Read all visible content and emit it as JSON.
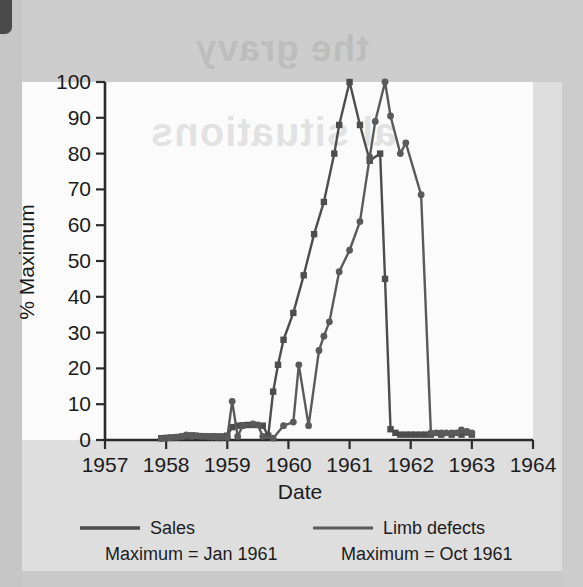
{
  "chart_data": {
    "type": "line",
    "title": "",
    "xlabel": "Date",
    "ylabel": "% Maximum",
    "xlim": [
      1957,
      1964
    ],
    "ylim": [
      0,
      100
    ],
    "xticks": [
      "1957",
      "1958",
      "1959",
      "1960",
      "1961",
      "1962",
      "1963",
      "1964"
    ],
    "yticks": [
      "0",
      "10",
      "20",
      "30",
      "40",
      "50",
      "60",
      "70",
      "80",
      "90",
      "100"
    ],
    "grid": false,
    "legend_position": "below-axes",
    "series": [
      {
        "name": "Sales",
        "note": "Maximum = Jan 1961",
        "marker": "square",
        "color": "#4d4d4d",
        "points": [
          [
            1957.92,
            0.5
          ],
          [
            1958.0,
            0.6
          ],
          [
            1958.08,
            0.7
          ],
          [
            1958.17,
            0.8
          ],
          [
            1958.25,
            0.9
          ],
          [
            1958.33,
            1.0
          ],
          [
            1958.42,
            1.3
          ],
          [
            1958.5,
            1.1
          ],
          [
            1958.58,
            1.0
          ],
          [
            1958.67,
            1.0
          ],
          [
            1958.75,
            1.0
          ],
          [
            1958.83,
            1.0
          ],
          [
            1958.92,
            1.0
          ],
          [
            1959.0,
            1.2
          ],
          [
            1959.08,
            3.6
          ],
          [
            1959.17,
            4.0
          ],
          [
            1959.25,
            4.1
          ],
          [
            1959.33,
            4.2
          ],
          [
            1959.42,
            4.2
          ],
          [
            1959.58,
            4.0
          ],
          [
            1959.67,
            1.2
          ],
          [
            1959.75,
            13.5
          ],
          [
            1959.83,
            21.0
          ],
          [
            1959.92,
            28.0
          ],
          [
            1960.08,
            35.5
          ],
          [
            1960.25,
            46.0
          ],
          [
            1960.42,
            57.5
          ],
          [
            1960.58,
            66.5
          ],
          [
            1960.75,
            80.0
          ],
          [
            1960.83,
            88.0
          ],
          [
            1961.0,
            100.0
          ],
          [
            1961.17,
            88.0
          ],
          [
            1961.33,
            78.0
          ],
          [
            1961.5,
            80.0
          ],
          [
            1961.58,
            45.0
          ],
          [
            1961.67,
            3.0
          ],
          [
            1961.75,
            2.0
          ],
          [
            1961.83,
            1.5
          ],
          [
            1961.92,
            1.5
          ],
          [
            1962.0,
            1.5
          ],
          [
            1962.08,
            1.5
          ],
          [
            1962.17,
            1.5
          ],
          [
            1962.25,
            1.5
          ],
          [
            1962.33,
            1.5
          ],
          [
            1962.5,
            1.5
          ],
          [
            1962.67,
            1.5
          ],
          [
            1962.83,
            1.5
          ],
          [
            1963.0,
            1.5
          ]
        ]
      },
      {
        "name": "Limb defects",
        "note": "Maximum = Oct 1961",
        "marker": "circle",
        "color": "#5a5a5a",
        "points": [
          [
            1957.92,
            0.4
          ],
          [
            1958.0,
            0.5
          ],
          [
            1958.08,
            0.6
          ],
          [
            1958.17,
            0.8
          ],
          [
            1958.25,
            1.0
          ],
          [
            1958.33,
            1.4
          ],
          [
            1958.42,
            1.0
          ],
          [
            1958.5,
            1.2
          ],
          [
            1958.58,
            1.1
          ],
          [
            1958.67,
            1.0
          ],
          [
            1958.75,
            0.9
          ],
          [
            1958.83,
            0.8
          ],
          [
            1958.92,
            0.8
          ],
          [
            1959.0,
            0.7
          ],
          [
            1959.08,
            10.8
          ],
          [
            1959.17,
            1.0
          ],
          [
            1959.25,
            4.0
          ],
          [
            1959.42,
            4.5
          ],
          [
            1959.5,
            4.2
          ],
          [
            1959.58,
            1.0
          ],
          [
            1959.75,
            0.5
          ],
          [
            1959.92,
            4.0
          ],
          [
            1960.08,
            5.0
          ],
          [
            1960.17,
            21.0
          ],
          [
            1960.33,
            4.0
          ],
          [
            1960.5,
            25.0
          ],
          [
            1960.58,
            29.0
          ],
          [
            1960.67,
            33.0
          ],
          [
            1960.83,
            47.0
          ],
          [
            1961.0,
            53.0
          ],
          [
            1961.17,
            61.0
          ],
          [
            1961.33,
            79.0
          ],
          [
            1961.42,
            89.0
          ],
          [
            1961.58,
            100.0
          ],
          [
            1961.67,
            90.5
          ],
          [
            1961.83,
            80.0
          ],
          [
            1961.92,
            83.0
          ],
          [
            1962.17,
            68.5
          ],
          [
            1962.33,
            2.0
          ],
          [
            1962.42,
            2.0
          ],
          [
            1962.5,
            2.0
          ],
          [
            1962.58,
            2.0
          ],
          [
            1962.67,
            2.0
          ],
          [
            1962.75,
            2.0
          ],
          [
            1962.83,
            2.8
          ],
          [
            1962.92,
            2.4
          ],
          [
            1963.0,
            2.0
          ]
        ]
      }
    ]
  },
  "axes": {
    "y_title": "% Maximum",
    "x_title": "Date"
  },
  "legend": {
    "left": {
      "label": "Sales",
      "maximum": "Maximum = Jan 1961",
      "swatch": "line-swatch-sales"
    },
    "right": {
      "label": "Limb defects",
      "maximum": "Maximum = Oct 1961",
      "swatch": "line-swatch-limb-defects"
    }
  },
  "background": {
    "watermark_lines": [
      "the gravy",
      "al situations",
      "reverse page bleed"
    ]
  },
  "colors": {
    "ink": "#1c1c1c",
    "sales_line": "#4d4d4d",
    "limb_line": "#5a5a5a",
    "paper": "#dedede",
    "panel": "#fbfbfb"
  }
}
